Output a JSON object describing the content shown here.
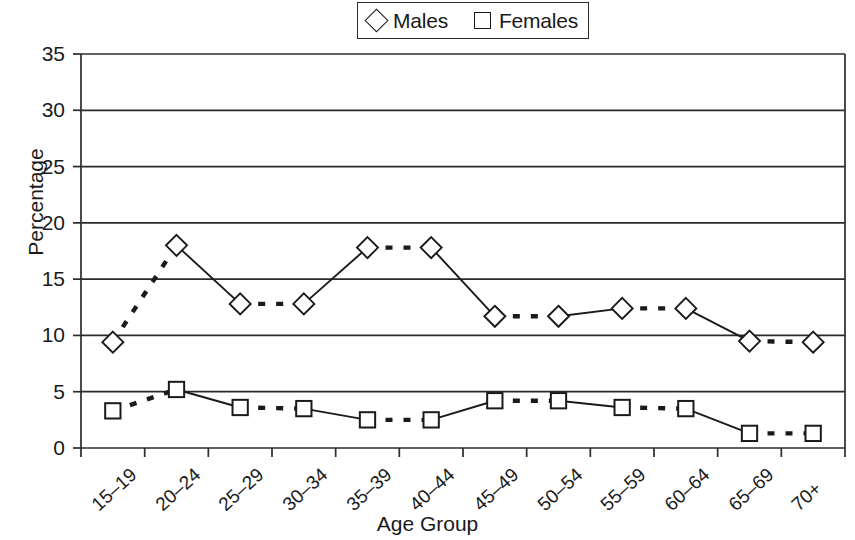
{
  "chart_data": {
    "type": "line",
    "title": "",
    "xlabel": "Age Group",
    "ylabel": "Percentage",
    "ylim": [
      0,
      35
    ],
    "yticks": [
      0,
      5,
      10,
      15,
      20,
      25,
      30,
      35
    ],
    "grid": true,
    "legend_position": "top-center",
    "categories": [
      "15–19",
      "20–24",
      "25–29",
      "30–34",
      "35–39",
      "40–44",
      "45–49",
      "50–54",
      "55–59",
      "60–64",
      "65–69",
      "70+"
    ],
    "series": [
      {
        "name": "Males",
        "marker": "diamond-open",
        "values": [
          9.4,
          18.0,
          12.8,
          12.8,
          17.8,
          17.8,
          11.7,
          11.7,
          12.4,
          12.4,
          9.5,
          9.4
        ]
      },
      {
        "name": "Females",
        "marker": "square-open",
        "values": [
          3.3,
          5.2,
          3.6,
          3.5,
          2.5,
          2.5,
          4.2,
          4.2,
          3.6,
          3.5,
          1.3,
          1.3
        ]
      }
    ]
  },
  "legend": {
    "entries": [
      {
        "label": "Males",
        "marker": "diamond-open"
      },
      {
        "label": "Females",
        "marker": "square-open"
      }
    ]
  },
  "axes": {
    "y_title": "Percentage",
    "x_title": "Age Group",
    "y_tick_labels": [
      "35",
      "30",
      "25",
      "20",
      "15",
      "10",
      "5",
      "0"
    ],
    "x_tick_labels": [
      "15–19",
      "20–24",
      "25–29",
      "30–34",
      "35–39",
      "40–44",
      "45–49",
      "50–54",
      "55–59",
      "60–64",
      "65–69",
      "70+"
    ]
  },
  "style": {
    "ink": "#1a1a1a",
    "grid_color": "#2b2b2b",
    "background": "#ffffff"
  }
}
